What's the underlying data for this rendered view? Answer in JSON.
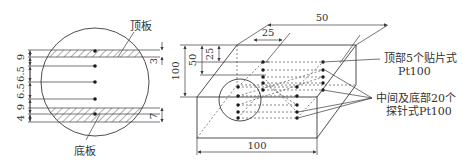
{
  "figure": {
    "left_view": {
      "top_plate_label": "顶板",
      "bottom_plate_label": "底板",
      "left_dims": [
        "9",
        "6.5",
        "6.5",
        "9",
        "4"
      ],
      "right_dims": [
        "3",
        "7"
      ]
    },
    "right_view": {
      "dims": {
        "width_top": "50",
        "offset_top": "25",
        "height_total": "100",
        "height_mid": "50",
        "height_small": "25",
        "length_bottom": "100"
      },
      "annotation_top_line1": "顶部5个贴片式",
      "annotation_top_line2": "Pt100",
      "annotation_mid_line1": "中间及底部20个",
      "annotation_mid_line2": "探针式Pt100"
    },
    "colors": {
      "line": "#3a3a3a",
      "text": "#333333",
      "background": "#ffffff"
    }
  }
}
